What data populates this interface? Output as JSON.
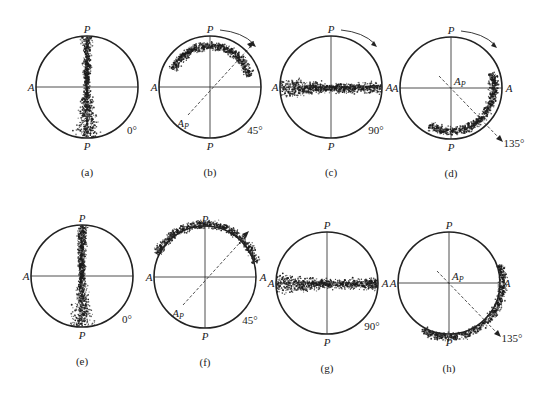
{
  "figure": {
    "panels": [
      {
        "id": "a",
        "caption": "(a)",
        "angle": "0°",
        "polarizer_label": "P",
        "analyzer_label": "A",
        "cx": 87,
        "cy": 87,
        "pattern": "vertical",
        "arrow": false,
        "ap_label": ""
      },
      {
        "id": "b",
        "caption": "(b)",
        "angle": "45°",
        "polarizer_label": "P",
        "analyzer_label": "A",
        "cx": 210,
        "cy": 87,
        "pattern": "arc45",
        "arrow": true,
        "ap_label": "A",
        "ap_sub": "P"
      },
      {
        "id": "c",
        "caption": "(c)",
        "angle": "90°",
        "polarizer_label": "P",
        "analyzer_label": "A",
        "cx": 331,
        "cy": 87,
        "pattern": "horizontal",
        "arrow": true,
        "ap_label": ""
      },
      {
        "id": "d",
        "caption": "(d)",
        "angle": "135°",
        "polarizer_label": "P",
        "analyzer_label": "A",
        "cx": 451,
        "cy": 88,
        "pattern": "arc135",
        "arrow": true,
        "ap_label": "A",
        "ap_sub": "P"
      },
      {
        "id": "e",
        "caption": "(e)",
        "angle": "0°",
        "polarizer_label": "P",
        "analyzer_label": "A",
        "cx": 82,
        "cy": 276,
        "pattern": "vertical",
        "arrow": false,
        "ap_label": ""
      },
      {
        "id": "f",
        "caption": "(f)",
        "angle": "45°",
        "polarizer_label": "P",
        "analyzer_label": "A",
        "cx": 205,
        "cy": 277,
        "pattern": "arc45out",
        "arrow": true,
        "ap_label": "A",
        "ap_sub": "P"
      },
      {
        "id": "g",
        "caption": "(g)",
        "angle": "90°",
        "polarizer_label": "P",
        "analyzer_label": "A",
        "cx": 327,
        "cy": 283,
        "pattern": "horizontal",
        "arrow": false,
        "ap_label": ""
      },
      {
        "id": "h",
        "caption": "(h)",
        "angle": "135°",
        "polarizer_label": "P",
        "analyzer_label": "A",
        "cx": 449,
        "cy": 283,
        "pattern": "arc135out",
        "arrow": true,
        "ap_label": "A",
        "ap_sub": "P"
      }
    ],
    "radius": 51,
    "colors": {
      "line": "#222222",
      "dots": "#1a1a1a"
    }
  }
}
